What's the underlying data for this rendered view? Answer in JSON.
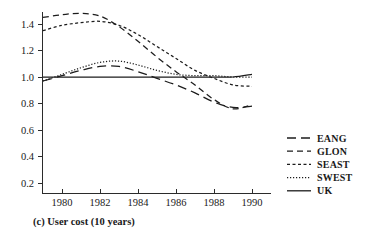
{
  "figure": {
    "caption": "(c) User cost  (10 years)",
    "background_color": "#ffffff",
    "line_color": "#1c1c1c"
  },
  "axes": {
    "y_ticks": [
      "0.2",
      "0.4",
      "0.6",
      "0.8",
      "1.0",
      "1.2",
      "1.4"
    ],
    "x_ticks": [
      "1980",
      "1982",
      "1984",
      "1986",
      "1988",
      "1990"
    ]
  },
  "legend": {
    "items": [
      {
        "label": "EANG",
        "dash": "9,5"
      },
      {
        "label": "GLON",
        "dash": "6,4"
      },
      {
        "label": "SEAST",
        "dash": "3,2.5"
      },
      {
        "label": "SWEST",
        "dash": "1.2,1.8"
      },
      {
        "label": "UK",
        "dash": "none"
      }
    ]
  },
  "chart_data": {
    "type": "line",
    "title": "(c) User cost  (10 years)",
    "xlabel": "",
    "ylabel": "",
    "xlim": [
      1978.8,
      1990.6
    ],
    "ylim": [
      0.12,
      1.52
    ],
    "grid": false,
    "legend_position": "right",
    "x": [
      1979,
      1980,
      1981,
      1982,
      1983,
      1984,
      1985,
      1986,
      1987,
      1988,
      1989,
      1990
    ],
    "series": [
      {
        "name": "EANG",
        "dash": "9,5",
        "values": [
          0.97,
          1.01,
          1.05,
          1.08,
          1.08,
          1.04,
          0.99,
          0.94,
          0.88,
          0.81,
          0.77,
          0.78
        ]
      },
      {
        "name": "GLON",
        "dash": "6,4",
        "values": [
          1.45,
          1.47,
          1.48,
          1.46,
          1.38,
          1.27,
          1.15,
          1.04,
          0.94,
          0.83,
          0.76,
          0.79
        ]
      },
      {
        "name": "SEAST",
        "dash": "3,2.5",
        "values": [
          1.35,
          1.39,
          1.41,
          1.42,
          1.39,
          1.32,
          1.23,
          1.14,
          1.05,
          0.99,
          0.94,
          0.93
        ]
      },
      {
        "name": "SWEST",
        "dash": "1.2,1.8",
        "values": [
          0.97,
          1.02,
          1.07,
          1.11,
          1.12,
          1.09,
          1.05,
          1.02,
          1.01,
          1.01,
          1.0,
          1.0
        ]
      },
      {
        "name": "UK",
        "dash": "none",
        "values": [
          1.0,
          1.0,
          1.0,
          1.0,
          1.0,
          1.0,
          1.0,
          1.0,
          1.0,
          1.0,
          1.0,
          1.02
        ]
      }
    ]
  }
}
